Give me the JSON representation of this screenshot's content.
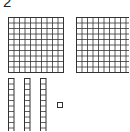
{
  "problem": {
    "number": "2"
  },
  "blocks": {
    "hundreds": 2,
    "tens": 3,
    "ones": 1
  },
  "colors": {
    "stroke": "#333333",
    "background": "#ffffff"
  }
}
